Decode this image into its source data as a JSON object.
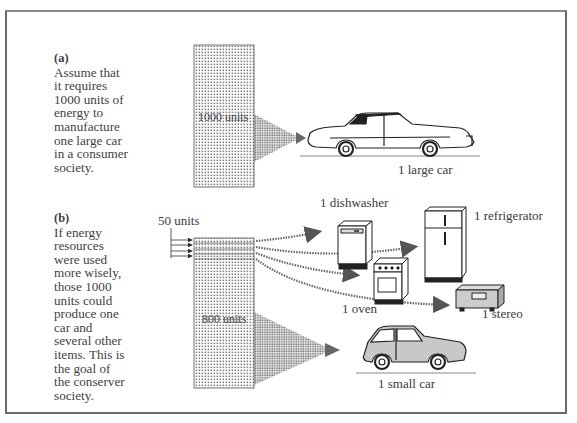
{
  "figure": {
    "panel_a": {
      "tag": "(a)",
      "caption_lines": [
        "Assume that",
        "it requires",
        "1000 units of",
        "energy to",
        "manufacture",
        "one large car",
        "in a consumer",
        "society."
      ],
      "bar_label": "1000 units",
      "output_label": "1 large car"
    },
    "panel_b": {
      "tag": "(b)",
      "caption_lines": [
        "If energy",
        "resources",
        "were used",
        "more wisely,",
        "those 1000",
        "units could",
        "produce one",
        "car and",
        "several other",
        "items. This is",
        "the goal of",
        "the conserver",
        "society."
      ],
      "input_label": "50 units",
      "bar_label": "800 units",
      "outputs": {
        "dishwasher": "1 dishwasher",
        "refrigerator": "1 refrigerator",
        "oven": "1 oven",
        "stereo": "1 stereo",
        "small_car": "1 small car"
      }
    },
    "colors": {
      "ink": "#3a3a3a",
      "frame": "#6a6a6a",
      "dots": "#777777",
      "small_car_tint": "#c8c8c8"
    }
  }
}
